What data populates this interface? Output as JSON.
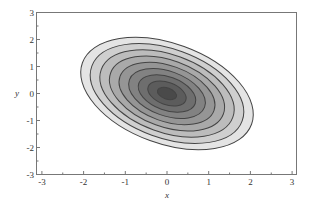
{
  "chart_data": {
    "type": "contour",
    "title": "",
    "xlabel": "x",
    "ylabel": "y",
    "xlim": [
      -3.1,
      3.1
    ],
    "ylim": [
      -3,
      3
    ],
    "xticks": [
      -3,
      -2,
      -1,
      0,
      1,
      2,
      3
    ],
    "yticks": [
      -3,
      -2,
      -1,
      0,
      1,
      2,
      3
    ],
    "xtick_labels": [
      "-3",
      "-2",
      "-1",
      "0",
      "1",
      "2",
      "3"
    ],
    "ytick_labels": [
      "-3",
      "-2",
      "-1",
      "0",
      "1",
      "2",
      "3"
    ],
    "grid": false,
    "legend": null,
    "filled": true,
    "center": [
      0,
      0
    ],
    "contours": {
      "count": 9,
      "rotation_deg": 20,
      "outer_semi_axes": [
        2.15,
        1.85
      ],
      "note": "concentric tilted ellipses, major axis descending left-to-right",
      "fill_colors": [
        "#e4e4e4",
        "#cfcfcf",
        "#bcbcbc",
        "#a9a9a9",
        "#959595",
        "#828282",
        "#6e6e6e",
        "#5c5c5c",
        "#4a4a4a"
      ],
      "line_color": "#444444"
    }
  },
  "axes": {
    "frame_color": "#777777"
  }
}
